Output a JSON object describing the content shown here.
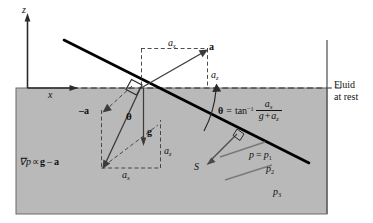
{
  "figure": {
    "name": "rigid-body-acceleration-fluid-diagram",
    "colors": {
      "fluid_fill": "#b9b9b9",
      "line": "#111111",
      "frame": "#6b6b6b",
      "thick_line": "#000000"
    }
  },
  "axes": {
    "z_label": "z",
    "x_label": "x"
  },
  "annotations": {
    "fluid_at_rest_line1": "Fluid",
    "fluid_at_rest_line2": "at rest",
    "accel_vector": "a",
    "neg_accel_vector": "–a",
    "gravity_vector": "g",
    "a_x_top": "a",
    "a_x_top_sub": "x",
    "a_z_right": "a",
    "a_z_right_sub": "z",
    "a_z_lower": "a",
    "a_z_lower_sub": "z",
    "a_x_lower": "a",
    "a_x_lower_sub": "x",
    "theta_symbol": "θ",
    "gradient_expr_grad": "∇",
    "gradient_expr_p": "p",
    "gradient_expr_prop": "∝",
    "gradient_expr_g": "g",
    "gradient_expr_minus": "–",
    "gradient_expr_a": "a",
    "s_label": "S",
    "pressure_p1_lhs": "p",
    "pressure_p1_eq": "=",
    "pressure_p1_rhs": "p",
    "pressure_p1_sub": "1",
    "pressure_p2": "p",
    "pressure_p2_sub": "2",
    "pressure_p3": "p",
    "pressure_p3_sub": "3"
  },
  "equation": {
    "theta": "θ",
    "equals": "=",
    "tan": "tan",
    "inverse_exp": "−1",
    "numerator": "a",
    "numerator_sub": "x",
    "denominator_g": "g",
    "denominator_plus": "+",
    "denominator_a": "a",
    "denominator_sub": "z"
  }
}
